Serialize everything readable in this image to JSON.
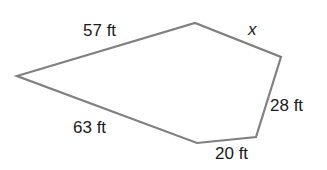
{
  "figure": {
    "shape": "pentagon",
    "stroke_color": "#808080",
    "stroke_width": 2.2,
    "fill": "none",
    "vertices": [
      {
        "name": "left",
        "x": 17,
        "y": 76
      },
      {
        "name": "top",
        "x": 195,
        "y": 23
      },
      {
        "name": "right",
        "x": 281,
        "y": 57
      },
      {
        "name": "bottom-right",
        "x": 256,
        "y": 137
      },
      {
        "name": "bottom",
        "x": 197,
        "y": 143
      }
    ],
    "sides": [
      {
        "id": "top-left",
        "label": "57 ft"
      },
      {
        "id": "top-right",
        "label": "x"
      },
      {
        "id": "right",
        "label": "28 ft"
      },
      {
        "id": "bottom-right",
        "label": "20 ft"
      },
      {
        "id": "bottom-left",
        "label": "63 ft"
      }
    ]
  }
}
